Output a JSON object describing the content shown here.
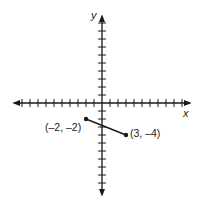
{
  "chart_data": {
    "type": "line",
    "title": "",
    "xlabel": "x",
    "ylabel": "y",
    "xlim": [
      -10,
      10
    ],
    "ylim": [
      -10,
      10
    ],
    "grid": false,
    "tick_step": 1,
    "series": [
      {
        "name": "segment",
        "points": [
          {
            "x": -2,
            "y": -2,
            "label": "(–2, –2)"
          },
          {
            "x": 3,
            "y": -4,
            "label": "(3, –4)"
          }
        ]
      }
    ]
  },
  "axes": {
    "x_label": "x",
    "y_label": "y"
  },
  "points": {
    "p1": "(–2, –2)",
    "p2": "(3, –4)"
  },
  "colors": {
    "ink": "#1a1a1a",
    "background": "#ffffff"
  }
}
